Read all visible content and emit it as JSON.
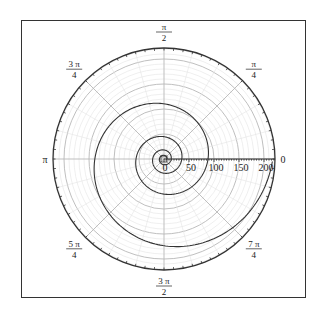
{
  "chart_data": {
    "type": "line",
    "coordinate_system": "polar",
    "title": "",
    "equation_estimate": {
      "a": 88,
      "b": 0.144,
      "theta_min": -18.85,
      "theta_max": 6.2832
    },
    "series": [
      {
        "name": "spiral",
        "color": "#333333",
        "sample_points": [
          {
            "theta": "0",
            "r": 88
          },
          {
            "theta": "pi/2",
            "r": 110
          },
          {
            "theta": "pi",
            "r": 138
          },
          {
            "theta": "3pi/2",
            "r": 172
          },
          {
            "theta": "2pi",
            "r": 217
          },
          {
            "theta": "-pi",
            "r": 56
          },
          {
            "theta": "-2pi",
            "r": 36
          }
        ]
      }
    ],
    "radial_axis": {
      "range": [
        0,
        222
      ],
      "tick_labels": [
        "0",
        "50",
        "100",
        "150",
        "200"
      ],
      "tick_values": [
        0,
        50,
        100,
        150,
        200
      ],
      "major_circle_step": 50,
      "minor_circle_step": 10
    },
    "angular_axis": {
      "tick_labels": [
        {
          "angle_deg": 0,
          "text": "0"
        },
        {
          "angle_deg": 45,
          "num": "π",
          "den": "4"
        },
        {
          "angle_deg": 90,
          "num": "π",
          "den": "2"
        },
        {
          "angle_deg": 135,
          "num": "3 π",
          "den": "4"
        },
        {
          "angle_deg": 180,
          "text": "π"
        },
        {
          "angle_deg": 225,
          "num": "5 π",
          "den": "4"
        },
        {
          "angle_deg": 270,
          "num": "3 π",
          "den": "2"
        },
        {
          "angle_deg": 315,
          "num": "7 π",
          "den": "4"
        }
      ],
      "spoke_step_deg": 45,
      "minor_spoke_step_deg": 15
    },
    "grid": true,
    "legend": "none"
  },
  "colors": {
    "axis": "#333333",
    "major_grid": "#b8b8b8",
    "minor_grid": "#e4e4e4",
    "curve": "#333333"
  }
}
